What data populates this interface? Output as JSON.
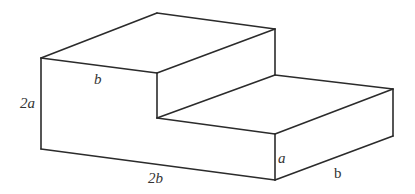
{
  "figure": {
    "type": "3d-step-block",
    "line_color": "#2b2b2b",
    "vertices": {
      "A": [
        41,
        58
      ],
      "B": [
        157,
        13
      ],
      "C": [
        275,
        29
      ],
      "D": [
        157,
        73
      ],
      "E": [
        157,
        118
      ],
      "F": [
        275,
        75
      ],
      "G": [
        393,
        89
      ],
      "H": [
        393,
        136
      ],
      "I": [
        275,
        134
      ],
      "J": [
        275,
        180
      ],
      "K": [
        41,
        149
      ]
    },
    "edges": [
      [
        "A",
        "B"
      ],
      [
        "B",
        "C"
      ],
      [
        "A",
        "D"
      ],
      [
        "D",
        "C"
      ],
      [
        "C",
        "F"
      ],
      [
        "D",
        "E"
      ],
      [
        "E",
        "F"
      ],
      [
        "F",
        "G"
      ],
      [
        "E",
        "I"
      ],
      [
        "I",
        "G"
      ],
      [
        "G",
        "H"
      ],
      [
        "I",
        "J"
      ],
      [
        "J",
        "H"
      ],
      [
        "A",
        "K"
      ],
      [
        "K",
        "J"
      ]
    ],
    "labels": {
      "top_width": "b",
      "left_height": "2a",
      "bottom_length": "2b",
      "front_step_height": "a",
      "right_depth": "b"
    }
  }
}
